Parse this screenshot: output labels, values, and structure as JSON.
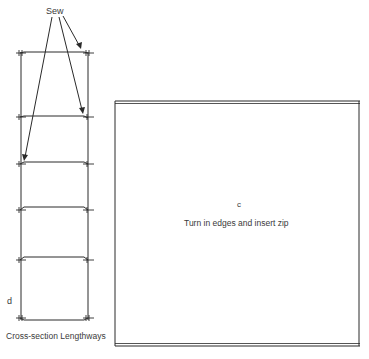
{
  "labels": {
    "sew": "Sew",
    "d": "d",
    "caption": "Cross-section Lengthways",
    "c": "c",
    "instruction": "Turn in edges and insert zip"
  },
  "colors": {
    "line": "#2a2a2a",
    "background": "#ffffff"
  },
  "left_diagram": {
    "compartment_lines_y": [
      53,
      117,
      164,
      210,
      260,
      318
    ]
  }
}
